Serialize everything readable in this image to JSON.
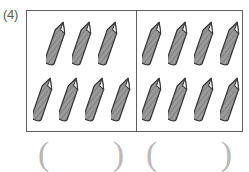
{
  "item": {
    "number_label": "(4)",
    "object_name": "pencil"
  },
  "colors": {
    "frame_stroke": "#5e5e5e",
    "pencil_body": "#9a9a9a",
    "pencil_outline": "#333333",
    "pencil_tip": "#ffffff",
    "paren_color": "#b9b9b9",
    "label_color": "#5a5a5a",
    "background": "#ffffff"
  },
  "groups": [
    {
      "name": "left-group",
      "rows": [
        {
          "count": 3
        },
        {
          "count": 4
        }
      ],
      "total": 7,
      "answer_value": "",
      "paren_open": "(",
      "paren_close": ")"
    },
    {
      "name": "right-group",
      "rows": [
        {
          "count": 4
        },
        {
          "count": 4
        }
      ],
      "total": 8,
      "answer_value": "",
      "paren_open": "(",
      "paren_close": ")"
    }
  ]
}
